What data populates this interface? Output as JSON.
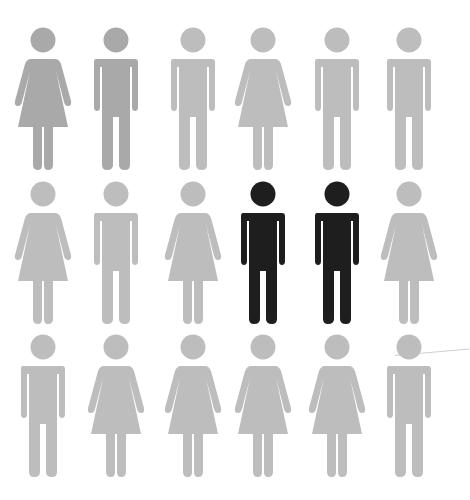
{
  "caption": "Grid of 18 person pictograms, two highlighted in black",
  "colors": {
    "background": "#ffffff",
    "gray_light": "#bdbdbd",
    "gray_dark": "#a9a9a9",
    "highlight": "#1e1e1e"
  },
  "grid": {
    "columns_x": [
      43,
      116,
      193,
      263,
      337,
      409
    ],
    "rows_head_y": [
      40,
      194,
      347
    ],
    "rows": [
      [
        {
          "type": "female",
          "color": "#a9a9a9"
        },
        {
          "type": "male",
          "color": "#a9a9a9"
        },
        {
          "type": "male",
          "color": "#bdbdbd"
        },
        {
          "type": "female",
          "color": "#bdbdbd"
        },
        {
          "type": "male",
          "color": "#bdbdbd"
        },
        {
          "type": "male",
          "color": "#bdbdbd"
        }
      ],
      [
        {
          "type": "female",
          "color": "#bdbdbd"
        },
        {
          "type": "male",
          "color": "#bdbdbd"
        },
        {
          "type": "female",
          "color": "#bdbdbd"
        },
        {
          "type": "male",
          "color": "#1e1e1e"
        },
        {
          "type": "male",
          "color": "#1e1e1e"
        },
        {
          "type": "female",
          "color": "#bdbdbd"
        }
      ],
      [
        {
          "type": "male",
          "color": "#bdbdbd"
        },
        {
          "type": "female",
          "color": "#bdbdbd"
        },
        {
          "type": "female",
          "color": "#bdbdbd"
        },
        {
          "type": "female",
          "color": "#bdbdbd"
        },
        {
          "type": "female",
          "color": "#bdbdbd"
        },
        {
          "type": "male",
          "color": "#bdbdbd"
        }
      ]
    ]
  },
  "counts": {
    "total": 18,
    "male": 9,
    "female": 9,
    "highlighted": 2
  }
}
